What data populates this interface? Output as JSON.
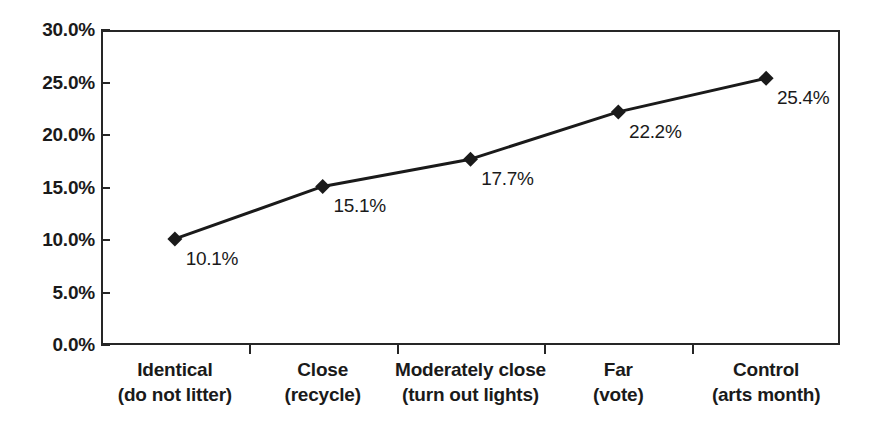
{
  "chart_data": {
    "type": "line",
    "title": "",
    "subtitle": "",
    "xlabel": "",
    "ylabel": "",
    "categories": [
      "Identical\n(do not litter)",
      "Close\n(recycle)",
      "Moderately close\n(turn out lights)",
      "Far\n(vote)",
      "Control\n(arts month)"
    ],
    "category_lines": [
      {
        "line1": "Identical",
        "line2": "(do not litter)"
      },
      {
        "line1": "Close",
        "line2": "(recycle)"
      },
      {
        "line1": "Moderately close",
        "line2": "(turn out lights)"
      },
      {
        "line1": "Far",
        "line2": "(vote)"
      },
      {
        "line1": "Control",
        "line2": "(arts month)"
      }
    ],
    "values": [
      10.1,
      15.1,
      17.7,
      22.2,
      25.4
    ],
    "point_labels": [
      "10.1%",
      "15.1%",
      "17.7%",
      "22.2%",
      "25.4%"
    ],
    "ylim": [
      0,
      30
    ],
    "ytick_values": [
      0,
      5,
      10,
      15,
      20,
      25,
      30
    ],
    "ytick_labels": [
      "0.0%",
      "5.0%",
      "10.0%",
      "15.0%",
      "20.0%",
      "25.0%",
      "30.0%"
    ],
    "grid": false,
    "legend": false,
    "legend_position": "none",
    "marker": "diamond",
    "series_color": "#1a1a1a",
    "axis_color": "#262626",
    "background_color": "#ffffff"
  }
}
